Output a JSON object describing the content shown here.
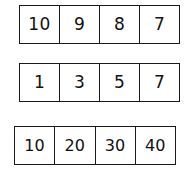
{
  "worksheet": {
    "title": "Number sequence strips",
    "background_color": "#ffffff",
    "border_color": "#1a1a1a",
    "text_color": "#111111",
    "rows": [
      {
        "name": "descending-sequence",
        "cells": [
          "10",
          "9",
          "8",
          "7"
        ]
      },
      {
        "name": "odd-numbers-sequence",
        "cells": [
          "1",
          "3",
          "5",
          "7"
        ]
      },
      {
        "name": "multiples-of-ten-sequence",
        "cells": [
          "10",
          "20",
          "30",
          "40"
        ]
      }
    ]
  }
}
